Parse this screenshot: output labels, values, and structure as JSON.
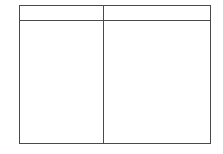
{
  "page": {
    "background_color": "#ffffff",
    "width": 223,
    "height": 154
  },
  "table": {
    "border_color": "#4a4a4a",
    "cell_background": "#ffffff",
    "columns": [
      {
        "key": "left",
        "header": "",
        "width_px": 84
      },
      {
        "key": "right",
        "header": "",
        "width_px": 106
      }
    ],
    "header_row": {
      "height_px": 15,
      "cells": [
        "",
        ""
      ]
    },
    "body_rows": [
      {
        "cells": [
          "",
          ""
        ]
      }
    ]
  }
}
